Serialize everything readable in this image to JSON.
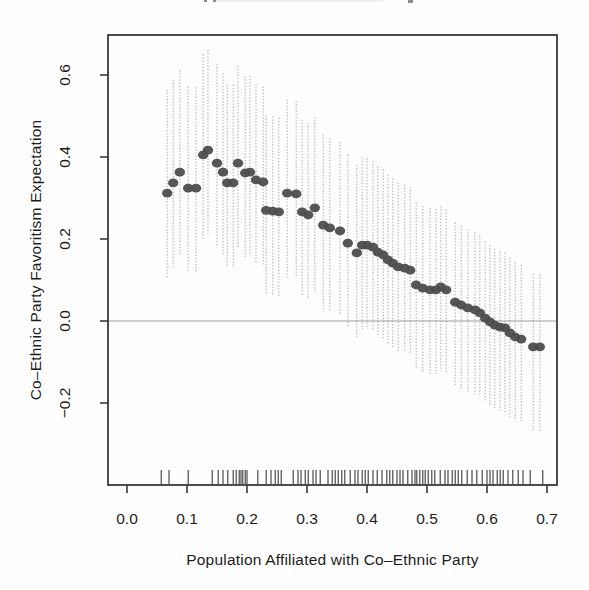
{
  "figure": {
    "note": "scanned statistical figure, title cropped at top edge"
  },
  "chart_data": {
    "type": "scatter",
    "title": "",
    "xlabel": "Population Affiliated with Co–Ethnic Party",
    "ylabel": "Co–Ethnic Party Favoritism Expectation",
    "xlim": [
      -0.032,
      0.717
    ],
    "ylim": [
      -0.4,
      0.698
    ],
    "grid": false,
    "legend": null,
    "zero_line_y": 0.0,
    "x_ticks": [
      {
        "label": "0.0",
        "value": 0.0
      },
      {
        "label": "0.1",
        "value": 0.1
      },
      {
        "label": "0.2",
        "value": 0.2
      },
      {
        "label": "0.3",
        "value": 0.3
      },
      {
        "label": "0.4",
        "value": 0.4
      },
      {
        "label": "0.5",
        "value": 0.5
      },
      {
        "label": "0.6",
        "value": 0.6
      },
      {
        "label": "0.7",
        "value": 0.7
      }
    ],
    "y_ticks": [
      {
        "label": "−0.2",
        "value": -0.2
      },
      {
        "label": "0.0",
        "value": 0.0
      },
      {
        "label": "0.2",
        "value": 0.2
      },
      {
        "label": "0.4",
        "value": 0.4
      },
      {
        "label": "0.6",
        "value": 0.6
      }
    ],
    "points_format": "[x, y, ci_low, ci_high]",
    "points": [
      [
        0.067,
        0.312,
        0.107,
        0.564
      ],
      [
        0.077,
        0.337,
        0.132,
        0.588
      ],
      [
        0.088,
        0.363,
        0.158,
        0.612
      ],
      [
        0.102,
        0.324,
        0.119,
        0.572
      ],
      [
        0.115,
        0.324,
        0.119,
        0.57
      ],
      [
        0.127,
        0.405,
        0.2,
        0.65
      ],
      [
        0.135,
        0.417,
        0.212,
        0.661
      ],
      [
        0.15,
        0.385,
        0.18,
        0.627
      ],
      [
        0.16,
        0.363,
        0.158,
        0.604
      ],
      [
        0.167,
        0.337,
        0.132,
        0.577
      ],
      [
        0.177,
        0.337,
        0.132,
        0.576
      ],
      [
        0.185,
        0.385,
        0.18,
        0.623
      ],
      [
        0.197,
        0.361,
        0.156,
        0.597
      ],
      [
        0.205,
        0.363,
        0.158,
        0.598
      ],
      [
        0.215,
        0.344,
        0.139,
        0.578
      ],
      [
        0.227,
        0.339,
        0.134,
        0.572
      ],
      [
        0.232,
        0.27,
        0.065,
        0.502
      ],
      [
        0.243,
        0.268,
        0.063,
        0.499
      ],
      [
        0.253,
        0.266,
        0.061,
        0.496
      ],
      [
        0.267,
        0.312,
        0.107,
        0.54
      ],
      [
        0.282,
        0.31,
        0.105,
        0.536
      ],
      [
        0.292,
        0.266,
        0.061,
        0.491
      ],
      [
        0.302,
        0.259,
        0.054,
        0.483
      ],
      [
        0.313,
        0.276,
        0.071,
        0.498
      ],
      [
        0.327,
        0.234,
        0.029,
        0.455
      ],
      [
        0.338,
        0.227,
        0.022,
        0.446
      ],
      [
        0.355,
        0.22,
        0.015,
        0.437
      ],
      [
        0.368,
        0.19,
        -0.015,
        0.406
      ],
      [
        0.383,
        0.166,
        -0.039,
        0.38
      ],
      [
        0.392,
        0.185,
        -0.02,
        0.398
      ],
      [
        0.4,
        0.185,
        -0.02,
        0.397
      ],
      [
        0.41,
        0.18,
        -0.025,
        0.391
      ],
      [
        0.418,
        0.168,
        -0.037,
        0.378
      ],
      [
        0.427,
        0.161,
        -0.044,
        0.37
      ],
      [
        0.435,
        0.149,
        -0.056,
        0.357
      ],
      [
        0.443,
        0.141,
        -0.064,
        0.348
      ],
      [
        0.452,
        0.132,
        -0.073,
        0.338
      ],
      [
        0.463,
        0.129,
        -0.076,
        0.333
      ],
      [
        0.472,
        0.124,
        -0.081,
        0.327
      ],
      [
        0.482,
        0.088,
        -0.117,
        0.29
      ],
      [
        0.493,
        0.08,
        -0.125,
        0.281
      ],
      [
        0.505,
        0.076,
        -0.129,
        0.275
      ],
      [
        0.515,
        0.076,
        -0.129,
        0.274
      ],
      [
        0.523,
        0.083,
        -0.122,
        0.28
      ],
      [
        0.532,
        0.076,
        -0.129,
        0.272
      ],
      [
        0.547,
        0.046,
        -0.159,
        0.24
      ],
      [
        0.557,
        0.039,
        -0.166,
        0.232
      ],
      [
        0.568,
        0.032,
        -0.173,
        0.224
      ],
      [
        0.58,
        0.027,
        -0.178,
        0.217
      ],
      [
        0.588,
        0.02,
        -0.185,
        0.209
      ],
      [
        0.597,
        0.007,
        -0.198,
        0.195
      ],
      [
        0.605,
        -0.002,
        -0.207,
        0.185
      ],
      [
        0.613,
        -0.01,
        -0.215,
        0.176
      ],
      [
        0.622,
        -0.015,
        -0.22,
        0.17
      ],
      [
        0.63,
        -0.017,
        -0.222,
        0.167
      ],
      [
        0.638,
        -0.029,
        -0.234,
        0.154
      ],
      [
        0.647,
        -0.039,
        -0.244,
        0.143
      ],
      [
        0.657,
        -0.044,
        -0.249,
        0.137
      ],
      [
        0.677,
        -0.063,
        -0.268,
        0.115
      ],
      [
        0.688,
        -0.063,
        -0.268,
        0.114
      ]
    ],
    "rug_x": [
      0.057,
      0.07,
      0.102,
      0.142,
      0.152,
      0.16,
      0.168,
      0.177,
      0.182,
      0.187,
      0.19,
      0.193,
      0.197,
      0.2,
      0.218,
      0.232,
      0.24,
      0.247,
      0.252,
      0.257,
      0.277,
      0.285,
      0.29,
      0.297,
      0.302,
      0.31,
      0.315,
      0.322,
      0.335,
      0.342,
      0.347,
      0.352,
      0.358,
      0.363,
      0.372,
      0.38,
      0.385,
      0.392,
      0.397,
      0.402,
      0.41,
      0.417,
      0.425,
      0.433,
      0.438,
      0.443,
      0.45,
      0.455,
      0.46,
      0.468,
      0.475,
      0.48,
      0.483,
      0.488,
      0.493,
      0.497,
      0.502,
      0.508,
      0.513,
      0.522,
      0.53,
      0.535,
      0.542,
      0.547,
      0.552,
      0.558,
      0.567,
      0.575,
      0.583,
      0.592,
      0.6,
      0.605,
      0.61,
      0.617,
      0.622,
      0.627,
      0.635,
      0.643,
      0.652,
      0.66,
      0.672,
      0.693
    ],
    "colors": {
      "point": "#4d4d4d",
      "error_bar": "#b4b4b4",
      "zero_line": "#9c9c9c",
      "axis": "#3a3a3a",
      "text": "#1c1c1c",
      "background": "#fefefe"
    }
  }
}
